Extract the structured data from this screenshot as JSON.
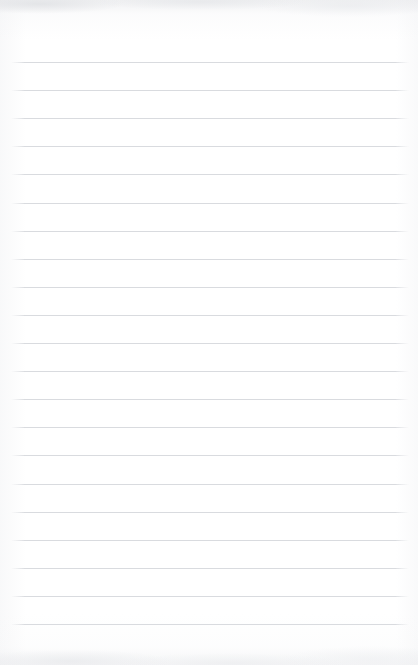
{
  "page": {
    "kind": "blank-lined-paper",
    "width": 418,
    "height": 665,
    "background_color": "#ffffff",
    "paper_tint_color": "#f7f8f9",
    "has_text_content": false,
    "content_text": ""
  },
  "rules": {
    "count": 21,
    "color": "#d9dbdf",
    "thickness_px": 1,
    "first_line_y": 62,
    "spacing_px": 28.1,
    "left_x": 24,
    "right_x": 396,
    "line_length_px": 372
  },
  "margins": {
    "top_px": 62,
    "bottom_px": 40,
    "left_px": 24,
    "right_px": 22
  },
  "labels": {
    "document_title": "Lined Paper",
    "writing_area": "Writing Area",
    "ruled_lines": "Ruled Lines"
  }
}
